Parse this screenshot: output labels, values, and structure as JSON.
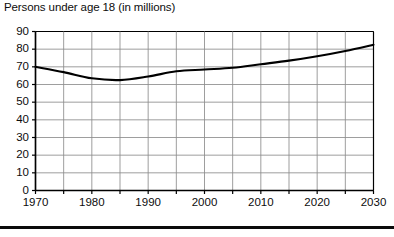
{
  "chart_data": {
    "type": "line",
    "title": "Persons under age 18 (in millions)",
    "xlabel": "",
    "ylabel": "",
    "xlim": [
      1970,
      2030
    ],
    "ylim": [
      0,
      90
    ],
    "grid": true,
    "legend": "none",
    "y_ticks": [
      90,
      80,
      70,
      60,
      50,
      40,
      30,
      20,
      10,
      0
    ],
    "x_ticks": [
      1970,
      1980,
      1990,
      2000,
      2010,
      2020,
      2030
    ],
    "x_minor_ticks": [
      1975,
      1985,
      1995,
      2005,
      2015,
      2025
    ],
    "x": [
      1970,
      1975,
      1980,
      1985,
      1990,
      1995,
      2000,
      2005,
      2010,
      2015,
      2020,
      2025,
      2030
    ],
    "values": [
      70.0,
      67.0,
      63.5,
      62.5,
      64.5,
      67.5,
      68.5,
      69.5,
      71.5,
      73.5,
      76.0,
      79.0,
      82.5
    ],
    "series": [
      {
        "name": "Persons under age 18",
        "values": [
          70.0,
          67.0,
          63.5,
          62.5,
          64.5,
          67.5,
          68.5,
          69.5,
          71.5,
          73.5,
          76.0,
          79.0,
          82.5
        ]
      }
    ],
    "line_color": "#000000",
    "grid_color": "#8c8c8c",
    "axis_color": "#000000"
  },
  "axes": {
    "y_tick_labels": [
      "90",
      "80",
      "70",
      "60",
      "50",
      "40",
      "30",
      "20",
      "10",
      "0"
    ],
    "x_tick_labels": [
      "1970",
      "1980",
      "1990",
      "2000",
      "2010",
      "2020",
      "2030"
    ]
  }
}
